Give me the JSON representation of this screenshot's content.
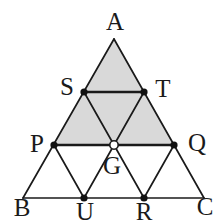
{
  "diagram": {
    "width": 218,
    "height": 222,
    "colors": {
      "background": "#ffffff",
      "shaded_fill": "#d9d9d9",
      "line": "#1a1a1a",
      "dot": "#111111",
      "open_dot_fill": "#ffffff"
    },
    "points": {
      "A": [
        114,
        39
      ],
      "B": [
        23,
        198
      ],
      "C": [
        204,
        198
      ],
      "S": [
        84,
        92
      ],
      "T": [
        144,
        92
      ],
      "P": [
        54,
        145
      ],
      "G": [
        114,
        145
      ],
      "Q": [
        174,
        145
      ],
      "U": [
        84,
        198
      ],
      "R": [
        144,
        198
      ]
    },
    "shaded_region": [
      "A",
      "P",
      "Q"
    ],
    "segments": [
      {
        "from": "A",
        "to": "B",
        "width": 1.7
      },
      {
        "from": "A",
        "to": "C",
        "width": 1.7
      },
      {
        "from": "B",
        "to": "C",
        "width": 1.7
      },
      {
        "from": "S",
        "to": "T",
        "width": 2.4
      },
      {
        "from": "P",
        "to": "Q",
        "width": 2.4
      },
      {
        "from": "S",
        "to": "R",
        "width": 1.7
      },
      {
        "from": "T",
        "to": "U",
        "width": 1.7
      },
      {
        "from": "P",
        "to": "U",
        "width": 1.7
      },
      {
        "from": "Q",
        "to": "R",
        "width": 1.7
      }
    ],
    "filled_dots": [
      "S",
      "T",
      "P",
      "Q",
      "U",
      "R"
    ],
    "filled_dot_radius": 3.6,
    "open_dots": [
      "G"
    ],
    "open_dot_radius": 4.2,
    "open_dot_stroke_width": 1.6,
    "labels": [
      {
        "text": "A",
        "x": 115,
        "y": 30
      },
      {
        "text": "S",
        "x": 67,
        "y": 95
      },
      {
        "text": "T",
        "x": 163,
        "y": 97
      },
      {
        "text": "P",
        "x": 37,
        "y": 152
      },
      {
        "text": "Q",
        "x": 197,
        "y": 151
      },
      {
        "text": "G",
        "x": 112,
        "y": 174
      },
      {
        "text": "B",
        "x": 22,
        "y": 216
      },
      {
        "text": "U",
        "x": 85,
        "y": 220
      },
      {
        "text": "R",
        "x": 144,
        "y": 220
      },
      {
        "text": "C",
        "x": 205,
        "y": 215
      }
    ]
  }
}
